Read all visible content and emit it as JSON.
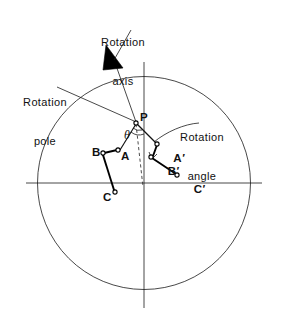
{
  "figure": {
    "title_alt": "Rotation of a rigid body about a rotation pole on a sphere",
    "background": "#ffffff",
    "ink_color": "#111111",
    "width": 283,
    "height": 324
  },
  "annotations": {
    "rotation_axis": {
      "line1": "Rotation",
      "line2": "axis"
    },
    "rotation_pole": {
      "line1": "Rotation",
      "line2": "pole"
    },
    "rotation_angle": {
      "line1": "Rotation",
      "line2": "angle"
    },
    "theta_symbol": "θ"
  },
  "points": {
    "P": {
      "label": "P",
      "x": 139,
      "y": 119
    },
    "A": {
      "label": "A",
      "x": 118,
      "y": 156
    },
    "B": {
      "label": "B",
      "x": 95,
      "y": 153
    },
    "C": {
      "label": "C",
      "x": 110,
      "y": 195
    },
    "A_prime": {
      "base": "A",
      "prime": "′",
      "x": 161,
      "y": 146
    },
    "B_prime": {
      "base": "B",
      "prime": "′",
      "x": 156,
      "y": 158
    },
    "C_prime": {
      "base": "C",
      "prime": "′",
      "x": 183,
      "y": 177
    }
  },
  "geometry": {
    "circle": {
      "cx": 144,
      "cy": 183,
      "r": 106.5
    },
    "horizontal_axis": {
      "x1": 26,
      "y1": 183,
      "x2": 262,
      "y2": 183
    },
    "vertical_axis": {
      "x1": 144,
      "y1": 62,
      "x2": 144,
      "y2": 308
    }
  },
  "colors": {
    "ink": "#111111",
    "hairline": "#1a1a1a",
    "dashed": "#3a3a3a",
    "paper": "#ffffff"
  }
}
